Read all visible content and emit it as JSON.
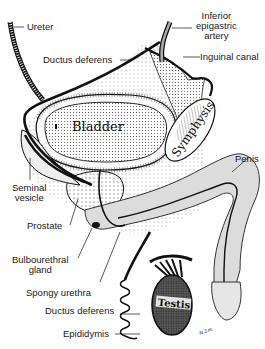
{
  "diagram": {
    "labels": {
      "ureter": "Ureter",
      "ductus_deferens_top": "Ductus deferens",
      "inferior_epigastric": [
        "Inferior",
        "epigastric",
        "artery"
      ],
      "inguinal_canal": "Inguinal canal",
      "seminal_vesicle": [
        "Seminal",
        "vesicle"
      ],
      "prostate": "Prostate",
      "bulbourethral_gland": [
        "Bulbourethral",
        "gland"
      ],
      "spongy_urethra": "Spongy urethra",
      "ductus_deferens_bottom": "Ductus deferens",
      "epididymis": "Epididymis",
      "penis": "Penis"
    },
    "organ_text": {
      "bladder": "Bladder",
      "symphysis": "Symphysis",
      "testis": "Testis",
      "signature": "N.J.m."
    },
    "colors": {
      "ink": "#111111",
      "shade": "#d9d9d9",
      "testis": "#3a3a3a",
      "background": "#ffffff"
    }
  }
}
